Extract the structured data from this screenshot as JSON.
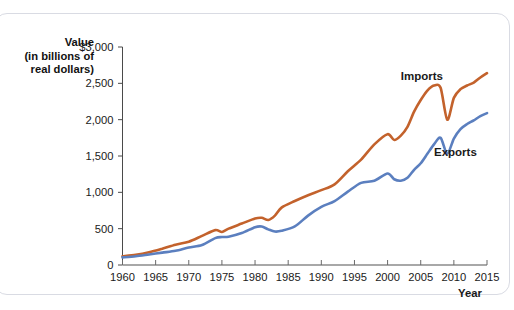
{
  "chart_data": {
    "type": "line",
    "title": "",
    "xlabel": "Year",
    "ylabel": "Value (in billions of real dollars)",
    "ylabel_lines": [
      "Value",
      "(in billions of",
      "real dollars)"
    ],
    "xlim": [
      1960,
      2015
    ],
    "ylim": [
      0,
      3000
    ],
    "grid": false,
    "legend_position": "inline-annotation",
    "y_ticks": [
      0,
      500,
      1000,
      1500,
      2000,
      2500,
      3000
    ],
    "y_tick_labels": [
      "0",
      "500",
      "1,000",
      "1,500",
      "2,000",
      "2,500",
      "$3,000"
    ],
    "x_ticks": [
      1960,
      1965,
      1970,
      1975,
      1980,
      1985,
      1990,
      1995,
      2000,
      2005,
      2010,
      2015
    ],
    "x_tick_labels": [
      "1960",
      "1965",
      "1970",
      "1975",
      "1980",
      "1985",
      "1990",
      "1995",
      "2000",
      "2005",
      "2010",
      "2015"
    ],
    "x": [
      1960,
      1962,
      1964,
      1966,
      1968,
      1970,
      1972,
      1974,
      1975,
      1976,
      1978,
      1980,
      1981,
      1982,
      1983,
      1984,
      1986,
      1988,
      1990,
      1992,
      1994,
      1996,
      1998,
      2000,
      2001,
      2002,
      2003,
      2004,
      2005,
      2006,
      2007,
      2008,
      2009,
      2010,
      2011,
      2012,
      2013,
      2014,
      2015
    ],
    "series": [
      {
        "name": "Imports",
        "color": "#c3622c",
        "values": [
          120,
          140,
          175,
          225,
          280,
          320,
          400,
          480,
          455,
          500,
          570,
          640,
          650,
          620,
          680,
          790,
          880,
          960,
          1030,
          1110,
          1290,
          1450,
          1660,
          1800,
          1720,
          1780,
          1900,
          2110,
          2270,
          2400,
          2470,
          2440,
          2000,
          2300,
          2420,
          2470,
          2510,
          2580,
          2640
        ]
      },
      {
        "name": "Exports",
        "color": "#5b7fbf",
        "values": [
          105,
          120,
          145,
          170,
          195,
          240,
          275,
          370,
          385,
          390,
          440,
          520,
          530,
          490,
          460,
          470,
          530,
          680,
          800,
          880,
          1010,
          1130,
          1160,
          1260,
          1180,
          1160,
          1200,
          1310,
          1400,
          1530,
          1660,
          1750,
          1530,
          1740,
          1870,
          1940,
          1990,
          2050,
          2090
        ]
      }
    ],
    "annotations": [
      {
        "text": "Imports",
        "x": 2002,
        "y": 2540
      },
      {
        "text": "Exports",
        "x": 2007,
        "y": 1500
      }
    ]
  }
}
